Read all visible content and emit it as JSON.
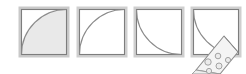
{
  "figure": {
    "width": 246,
    "height": 74,
    "background_color": "#ffffff",
    "panel_count": 4
  },
  "style": {
    "square_outline_color": "#7f7f7f",
    "square_outline_highlight": "#c8c8c8",
    "square_fill_color": "#ffffff",
    "arc_stroke_color": "#808080",
    "shaded_region_color": "#e6e6e6",
    "pizza_crust_color": "#f2f2f2",
    "pizza_outline_color": "#8c8c8c",
    "pepperoni_fill_color": "#ebebeb",
    "pepperoni_outline_color": "#9a9a9a"
  },
  "panels": [
    {
      "index": 1,
      "name": "square-with-shaded-quarter-arc",
      "x": 20,
      "y": 8,
      "size": 48,
      "shape": "quarter-circle arc centered at top-left corner, region outside arc shaded",
      "arc_center": "top-left",
      "shaded": true
    },
    {
      "index": 2,
      "name": "square-with-plain-quarter-arc",
      "x": 78,
      "y": 8,
      "size": 48,
      "shape": "quarter-circle arc centered at top-left corner, unshaded",
      "arc_center": "top-left",
      "shaded": false
    },
    {
      "index": 3,
      "name": "square-with-mirrored-quarter-arc",
      "x": 135,
      "y": 8,
      "size": 48,
      "shape": "quarter-circle arc centered at bottom-left corner, bulging to top-right",
      "arc_center": "bottom-left",
      "shaded": false
    },
    {
      "index": 4,
      "name": "square-with-pizza-slice",
      "x": 192,
      "y": 8,
      "size": 48,
      "shape": "square with quarter arc overlaid by a pizza slice wedge",
      "arc_center": "bottom-left",
      "shaded": false,
      "pizza": {
        "label": "pizza-slice",
        "pepperoni_count": 5
      }
    }
  ]
}
